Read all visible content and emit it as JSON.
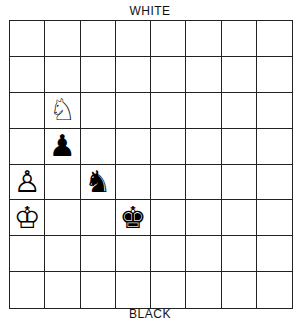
{
  "labels": {
    "top": "WHITE",
    "bottom": "BLACK"
  },
  "board": {
    "rows": 8,
    "cols": 8,
    "pieces": [
      {
        "row": 2,
        "col": 1,
        "color": "white",
        "type": "knight",
        "glyph": "♘"
      },
      {
        "row": 3,
        "col": 1,
        "color": "black",
        "type": "pawn",
        "glyph": "♟"
      },
      {
        "row": 4,
        "col": 0,
        "color": "white",
        "type": "pawn",
        "glyph": "♙"
      },
      {
        "row": 4,
        "col": 2,
        "color": "black",
        "type": "knight",
        "glyph": "♞"
      },
      {
        "row": 5,
        "col": 0,
        "color": "white",
        "type": "king",
        "glyph": "♔"
      },
      {
        "row": 5,
        "col": 3,
        "color": "black",
        "type": "king",
        "glyph": "♚"
      }
    ]
  }
}
